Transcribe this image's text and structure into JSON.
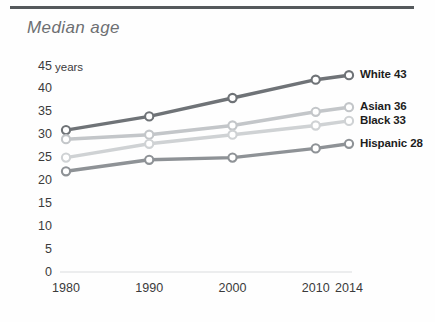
{
  "header": {
    "title": "Median age"
  },
  "chart_data": {
    "type": "line",
    "title": "Median age",
    "xlabel": "",
    "ylabel": "years",
    "x": [
      1980,
      1990,
      2000,
      2010,
      2014
    ],
    "categories": [
      "1980",
      "1990",
      "2000",
      "2010",
      "2014"
    ],
    "ylim": [
      0,
      45
    ],
    "yticks": [
      0,
      5,
      10,
      15,
      20,
      25,
      30,
      35,
      40,
      45
    ],
    "ytick_labels": [
      "0",
      "5",
      "10",
      "15",
      "20",
      "25",
      "30",
      "35",
      "40",
      "45"
    ],
    "y_unit_label": "years",
    "grid": false,
    "legend_position": "right",
    "series": [
      {
        "name": "White",
        "end_value_label": "43",
        "legend_label": "White 43",
        "color": "#6f7377",
        "values": [
          31,
          34,
          38,
          42,
          43
        ]
      },
      {
        "name": "Asian",
        "end_value_label": "36",
        "legend_label": "Asian 36",
        "color": "#c3c6c9",
        "values": [
          29,
          30,
          32,
          35,
          36
        ]
      },
      {
        "name": "Black",
        "end_value_label": "33",
        "legend_label": "Black 33",
        "color": "#cfd2d4",
        "values": [
          25,
          28,
          30,
          32,
          33
        ]
      },
      {
        "name": "Hispanic",
        "end_value_label": "28",
        "legend_label": "Hispanic 28",
        "color": "#8e9296",
        "values": [
          22,
          24.5,
          25,
          27,
          28
        ]
      }
    ]
  },
  "legend": {
    "items": [
      {
        "label": "White 43",
        "name": "White",
        "value": "43"
      },
      {
        "label": "Asian 36",
        "name": "Asian",
        "value": "36"
      },
      {
        "label": "Black 33",
        "name": "Black",
        "value": "33"
      },
      {
        "label": "Hispanic 28",
        "name": "Hispanic",
        "value": "28"
      }
    ]
  }
}
